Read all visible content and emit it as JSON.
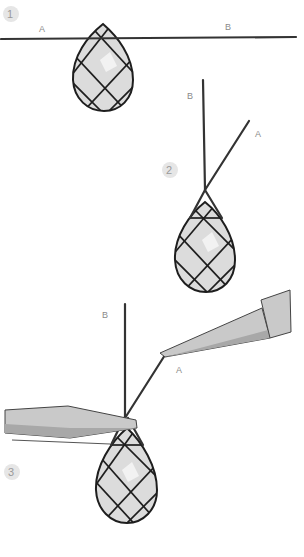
{
  "diagram": {
    "steps": [
      {
        "number": "1",
        "labels": {
          "a": "A",
          "b": "B"
        }
      },
      {
        "number": "2",
        "labels": {
          "a": "A",
          "b": "B"
        }
      },
      {
        "number": "3",
        "labels": {
          "a": "A",
          "b": "B"
        }
      }
    ],
    "colors": {
      "wire": "#333333",
      "bead_fill": "#dcdcdc",
      "bead_outline": "#1e1e1e",
      "tool": "#c9c9c9",
      "badge": "#e6e6e6",
      "label": "#8a8a8a"
    },
    "icons": [
      "bead-icon",
      "wire-icon",
      "pliers-icon"
    ]
  }
}
